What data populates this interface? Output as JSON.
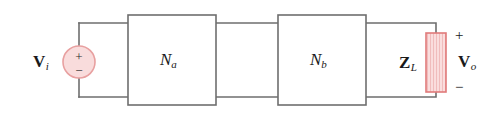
{
  "figure": {
    "type": "circuit-diagram",
    "width": 502,
    "height": 120,
    "background": "#ffffff"
  },
  "colors": {
    "wire": "#6e6e6e",
    "box_border": "#6e6e6e",
    "text": "#1a1a1a",
    "source_fill": "#f9dcdc",
    "source_border": "#e8a0a0",
    "load_fill": "#fadddd",
    "load_border": "#e07a7a",
    "load_hatch": "#eeb4b4"
  },
  "source": {
    "label": "V",
    "label_subscript": "i",
    "plus_sign": "+",
    "minus_sign": "−",
    "shape": "circle",
    "cx": 79,
    "cy": 62,
    "r": 16
  },
  "blocks": [
    {
      "name": "N",
      "subscript": "a",
      "x": 128,
      "y": 15,
      "width": 88,
      "height": 90
    },
    {
      "name": "N",
      "subscript": "b",
      "x": 278,
      "y": 15,
      "width": 88,
      "height": 90
    }
  ],
  "load": {
    "label": "Z",
    "label_subscript": "L",
    "x": 426,
    "y": 33,
    "width": 20,
    "height": 59
  },
  "output": {
    "label": "V",
    "label_subscript": "o",
    "plus_sign": "+",
    "minus_sign": "−"
  },
  "wires": {
    "top_rail_y": 23,
    "bottom_rail_y": 97,
    "left_rail_x": 79,
    "right_rail_x": 436
  }
}
